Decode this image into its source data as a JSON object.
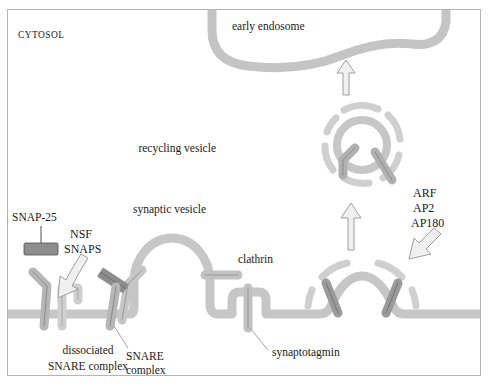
{
  "figure": {
    "background_color": "#ffffff",
    "border_color": "#b4b4b4",
    "membrane_color": "#c8c8c8",
    "protein_light_color": "#c9c9c9",
    "protein_dark_color": "#8a8a8a",
    "arrow_fill_color": "#efefef",
    "arrow_stroke_color": "#9a9a9a",
    "text_color": "#1a1a1a",
    "leader_line_color": "#8c8c8c"
  },
  "labels": {
    "cytosol": "CYTOSOL",
    "early_endosome": "early endosome",
    "recycling_vesicle": "recycling vesicle",
    "synaptic_vesicle": "synaptic vesicle",
    "clathrin": "clathrin",
    "synaptotagmin": "synaptotagmin",
    "snap25": "SNAP-25",
    "nsf": "NSF",
    "snaps": "SNAPS",
    "dissociated_line1": "dissociated",
    "dissociated_line2": "SNARE complex",
    "snare_line1": "SNARE",
    "snare_line2": "complex",
    "adaptors_line1": "ARF",
    "adaptors_line2": "AP2",
    "adaptors_line3": "AP180"
  },
  "structures": {
    "early_endosome": "large rounded compartment at top with thick gray membrane",
    "recycling_vesicle": "circular coated vesicle with clathrin coat dashes",
    "synaptic_vesicle": "omega-shaped vesicle fusing with plasma membrane",
    "clathrin_coated_pit": "dome-shaped membrane invagination with clathrin coat",
    "plasma_membrane": "horizontal gray band across lower third",
    "snare_complex": "dark bar overlapping bent light rod at membrane",
    "dissociated_snare_complex": "two separated bent light rods at membrane",
    "snap25_bar": "dark horizontal rectangle above membrane",
    "synaptotagmin_rod": "vertical rod spanning the membrane"
  },
  "arrows": [
    {
      "name": "endosome-arrow",
      "direction": "up",
      "meaning": "recycling vesicle to early endosome"
    },
    {
      "name": "recycling-arrow",
      "direction": "up",
      "meaning": "coated pit to recycling vesicle"
    },
    {
      "name": "adaptors-arrow",
      "direction": "down-left",
      "meaning": "ARF AP2 AP180 recruited to pit"
    },
    {
      "name": "nsf-snaps-arrow",
      "direction": "down-left",
      "meaning": "NSF SNAPS disassemble SNARE complex"
    }
  ]
}
